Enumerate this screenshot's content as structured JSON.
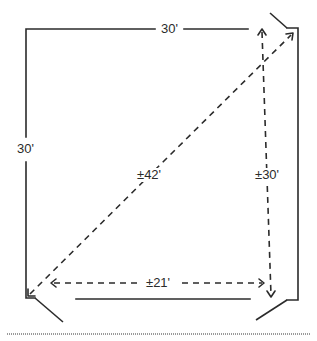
{
  "diagram": {
    "type": "room floor plan with measurements",
    "stroke_color": "#2b2b2b",
    "separator_color": "#9a9a9a",
    "labels": {
      "top_wall": "30'",
      "left_wall": "30'",
      "diagonal": "±42'",
      "vertical_measure": "±30'",
      "horizontal_measure": "±21'"
    },
    "elements": [
      {
        "kind": "wall",
        "side": "top",
        "label": "30'"
      },
      {
        "kind": "wall",
        "side": "left",
        "label": "30'"
      },
      {
        "kind": "wall",
        "side": "right"
      },
      {
        "kind": "wall",
        "side": "bottom"
      },
      {
        "kind": "door",
        "position": "top-right"
      },
      {
        "kind": "door",
        "position": "bottom-left"
      },
      {
        "kind": "door",
        "position": "bottom-right"
      },
      {
        "kind": "dimension-arrow",
        "direction": "diagonal",
        "label": "±42'"
      },
      {
        "kind": "dimension-arrow",
        "direction": "vertical",
        "label": "±30'"
      },
      {
        "kind": "dimension-arrow",
        "direction": "horizontal",
        "label": "±21'"
      }
    ]
  }
}
